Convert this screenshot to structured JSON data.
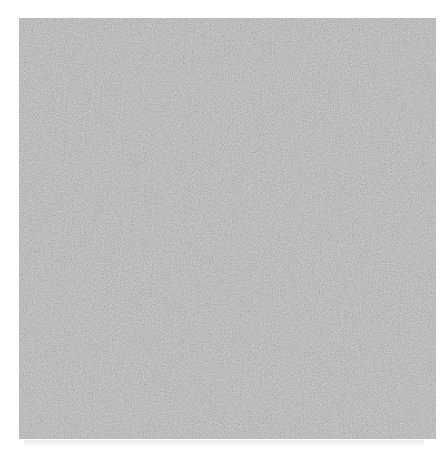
{
  "image": {
    "description": "Square patch of gray random noise texture on white background",
    "background_color": "#ffffff",
    "noise_mean_color": "#808080",
    "noise_min_color": "#6a6a6a",
    "noise_max_color": "#9a9a9a",
    "alt": "Gray noise texture"
  }
}
